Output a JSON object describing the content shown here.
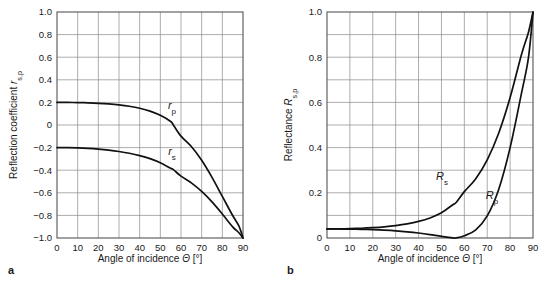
{
  "figure": {
    "panels": [
      {
        "letter": "a",
        "xlabel_main": "Angle of incidence",
        "xlabel_symbol": "Θ",
        "xlabel_unit": "[°]",
        "ylabel_main": "Reflection coefficient",
        "ylabel_symbol": "r",
        "ylabel_sub": "s,p",
        "xticks": [
          "0",
          "10",
          "20",
          "30",
          "40",
          "50",
          "60",
          "70",
          "80",
          "90"
        ],
        "yticks": [
          "1.0",
          "0.8",
          "0.6",
          "0.4",
          "0.2",
          "0",
          "−0.2",
          "−0.4",
          "−0.6",
          "−0.8",
          "−1.0"
        ],
        "curve_labels": [
          {
            "symbol": "r",
            "sub": "p"
          },
          {
            "symbol": "r",
            "sub": "s"
          }
        ]
      },
      {
        "letter": "b",
        "xlabel_main": "Angle of incidence",
        "xlabel_symbol": "Θ",
        "xlabel_unit": "[°]",
        "ylabel_main": "Reflectance",
        "ylabel_symbol": "R",
        "ylabel_sub": "s,p",
        "xticks": [
          "0",
          "10",
          "20",
          "30",
          "40",
          "50",
          "60",
          "70",
          "80",
          "90"
        ],
        "yticks": [
          "1.0",
          "0.8",
          "0.6",
          "0.4",
          "0.2",
          "0"
        ],
        "curve_labels": [
          {
            "symbol": "R",
            "sub": "s"
          },
          {
            "symbol": "R",
            "sub": "p"
          }
        ]
      }
    ],
    "colors": {
      "curve": "#111111",
      "grid": "#8a8a8a",
      "frame": "#555555",
      "text": "#1a1a1a",
      "background": "#ffffff"
    }
  },
  "chart_data": [
    {
      "type": "line",
      "title": "",
      "xlabel": "Angle of incidence Θ [°]",
      "ylabel": "Reflection coefficient r_s,p",
      "xlim": [
        0,
        90
      ],
      "ylim": [
        -1.0,
        1.0
      ],
      "xticks": [
        0,
        10,
        20,
        30,
        40,
        50,
        60,
        70,
        80,
        90
      ],
      "yticks": [
        -1.0,
        -0.8,
        -0.6,
        -0.4,
        -0.2,
        0,
        0.2,
        0.4,
        0.6,
        0.8,
        1.0
      ],
      "grid": true,
      "legend": "inline-labels",
      "x": [
        0,
        5,
        10,
        15,
        20,
        25,
        30,
        35,
        40,
        45,
        50,
        55,
        56.31,
        60,
        65,
        70,
        75,
        80,
        85,
        88,
        90
      ],
      "series": [
        {
          "name": "r_p",
          "values": [
            0.2,
            0.1996,
            0.1983,
            0.1959,
            0.1921,
            0.1864,
            0.178,
            0.1658,
            0.1482,
            0.1227,
            0.0856,
            0.0308,
            0.0,
            -0.0987,
            -0.1908,
            -0.3125,
            -0.4636,
            -0.6323,
            -0.8012,
            -0.8926,
            -1.0
          ]
        },
        {
          "name": "r_s",
          "values": [
            -0.2,
            -0.2008,
            -0.2033,
            -0.2076,
            -0.214,
            -0.2228,
            -0.2346,
            -0.2502,
            -0.2708,
            -0.298,
            -0.3344,
            -0.3838,
            -0.3949,
            -0.4529,
            -0.5125,
            -0.5883,
            -0.6809,
            -0.7883,
            -0.9015,
            -0.9537,
            -1.0
          ]
        }
      ]
    },
    {
      "type": "line",
      "title": "",
      "xlabel": "Angle of incidence Θ [°]",
      "ylabel": "Reflectance R_s,p",
      "xlim": [
        0,
        90
      ],
      "ylim": [
        0,
        1.0
      ],
      "xticks": [
        0,
        10,
        20,
        30,
        40,
        50,
        60,
        70,
        80,
        90
      ],
      "yticks": [
        0,
        0.2,
        0.4,
        0.6,
        0.8,
        1.0
      ],
      "grid": true,
      "legend": "inline-labels",
      "x": [
        0,
        5,
        10,
        15,
        20,
        25,
        30,
        35,
        40,
        45,
        50,
        55,
        56.31,
        60,
        65,
        70,
        75,
        80,
        85,
        88,
        90
      ],
      "series": [
        {
          "name": "R_s",
          "values": [
            0.04,
            0.0403,
            0.0413,
            0.0431,
            0.0458,
            0.0496,
            0.055,
            0.0626,
            0.0733,
            0.0888,
            0.1118,
            0.1473,
            0.156,
            0.2051,
            0.2627,
            0.3461,
            0.4636,
            0.6214,
            0.8127,
            0.9095,
            1.0
          ]
        },
        {
          "name": "R_p",
          "values": [
            0.04,
            0.0398,
            0.0393,
            0.0384,
            0.0369,
            0.0347,
            0.0317,
            0.0275,
            0.022,
            0.0151,
            0.0073,
            0.0009,
            0.0,
            0.0097,
            0.0364,
            0.0977,
            0.2149,
            0.3998,
            0.6419,
            0.7967,
            1.0
          ]
        }
      ]
    }
  ]
}
